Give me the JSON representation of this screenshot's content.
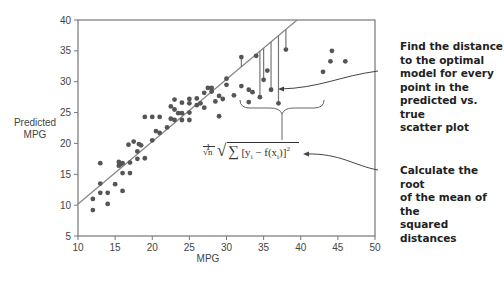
{
  "chart_data": {
    "type": "scatter",
    "title": "",
    "xlabel": "MPG",
    "ylabel": "Predicted MPG",
    "xlim": [
      10,
      50
    ],
    "ylim": [
      5,
      40
    ],
    "xticks": [
      10,
      15,
      20,
      25,
      30,
      35,
      40,
      45,
      50
    ],
    "yticks": [
      5,
      10,
      15,
      20,
      25,
      30,
      35,
      40
    ],
    "grid": false,
    "legend": null,
    "fit_line": {
      "x": [
        10,
        39.5
      ],
      "y": [
        10.2,
        40
      ]
    },
    "points": [
      [
        12,
        9.2
      ],
      [
        12,
        11
      ],
      [
        13,
        12
      ],
      [
        13,
        13.5
      ],
      [
        13,
        16.8
      ],
      [
        14,
        10.2
      ],
      [
        14,
        12
      ],
      [
        15,
        13.4
      ],
      [
        15.5,
        16.4
      ],
      [
        15.5,
        17
      ],
      [
        15.7,
        16.6
      ],
      [
        16,
        15.2
      ],
      [
        16,
        12.3
      ],
      [
        16,
        16.8
      ],
      [
        17,
        15.2
      ],
      [
        17,
        16.9
      ],
      [
        16.8,
        19.8
      ],
      [
        17.5,
        20.3
      ],
      [
        18,
        18.7
      ],
      [
        18,
        17.5
      ],
      [
        18.2,
        19.9
      ],
      [
        18.5,
        19.7
      ],
      [
        19,
        17.6
      ],
      [
        19,
        24.3
      ],
      [
        20,
        20.5
      ],
      [
        20,
        24.3
      ],
      [
        20.5,
        22
      ],
      [
        21,
        21.7
      ],
      [
        21,
        24.3
      ],
      [
        22,
        22.6
      ],
      [
        22.5,
        24
      ],
      [
        22.5,
        26
      ],
      [
        23,
        25.5
      ],
      [
        23,
        27.1
      ],
      [
        23,
        23.8
      ],
      [
        23.5,
        24.9
      ],
      [
        24,
        24.9
      ],
      [
        24,
        26.6
      ],
      [
        24,
        23.8
      ],
      [
        25,
        27.2
      ],
      [
        25,
        26.5
      ],
      [
        25,
        25
      ],
      [
        25,
        23.8
      ],
      [
        26,
        26.2
      ],
      [
        26,
        27.3
      ],
      [
        26.5,
        26.5
      ],
      [
        27,
        28.2
      ],
      [
        27,
        25.8
      ],
      [
        27.5,
        29
      ],
      [
        28,
        29
      ],
      [
        28,
        28.4
      ],
      [
        28.5,
        26.8
      ],
      [
        29,
        27.7
      ],
      [
        29,
        24.4
      ],
      [
        29.5,
        27.2
      ],
      [
        30,
        29.5
      ],
      [
        30,
        30.5
      ],
      [
        31,
        27.8
      ],
      [
        32,
        34
      ],
      [
        32,
        29.3
      ],
      [
        33,
        28.7
      ],
      [
        33,
        26.7
      ],
      [
        33.5,
        28.3
      ],
      [
        34,
        34.2
      ],
      [
        34.5,
        27.5
      ],
      [
        35,
        30.3
      ],
      [
        35.5,
        31.8
      ],
      [
        36,
        28.7
      ],
      [
        37,
        26.5
      ],
      [
        38,
        35.2
      ],
      [
        43,
        31.6
      ],
      [
        44,
        33.3
      ],
      [
        44.2,
        35
      ],
      [
        46,
        33.3
      ]
    ],
    "residual_points": [
      [
        32,
        34
      ],
      [
        34.5,
        27.5
      ],
      [
        35,
        30.3
      ],
      [
        36,
        28.7
      ],
      [
        37,
        26.5
      ],
      [
        38,
        35.2
      ]
    ],
    "annotations": [
      "Find the distance to the optimal model for every point in the predicted vs. true scatter plot",
      "Calculate the root of the mean of the squared distances"
    ]
  },
  "axes": {
    "xlabel": "MPG",
    "ylabel_line1": "Predicted",
    "ylabel_line2": "MPG",
    "xticks": [
      "10",
      "15",
      "20",
      "25",
      "30",
      "35",
      "40",
      "45",
      "50"
    ],
    "yticks": [
      "5",
      "10",
      "15",
      "20",
      "25",
      "30",
      "35",
      "40"
    ]
  },
  "formula": {
    "frac_num": "1",
    "frac_den": "√n",
    "body": "∑ [y",
    "sub_i": "i",
    "mid": " − f(x",
    "sub_i2": "i",
    "end": ")]",
    "sup": "2"
  },
  "annotations": {
    "top": [
      "Find the distance",
      "to the optimal",
      "model for every",
      "point in the",
      "predicted vs. true",
      "scatter plot"
    ],
    "bottom": [
      "Calculate the root",
      "of the mean of the",
      "squared distances"
    ]
  },
  "colors": {
    "point": "#555555",
    "line": "#888888",
    "axis": "#777777",
    "text": "#222222"
  }
}
